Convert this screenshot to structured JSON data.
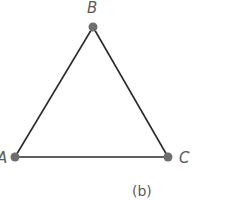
{
  "diagram": {
    "type": "triangle",
    "caption": "(b)",
    "vertices": [
      {
        "label": "A",
        "x": 15,
        "y": 157
      },
      {
        "label": "B",
        "x": 93,
        "y": 27
      },
      {
        "label": "C",
        "x": 168,
        "y": 157
      }
    ],
    "edges": [
      [
        "A",
        "B"
      ],
      [
        "B",
        "C"
      ],
      [
        "A",
        "C"
      ]
    ],
    "colors": {
      "edge": "#2a2a2a",
      "vertex": "#6e6e6e",
      "label": "#5a5a5a"
    }
  }
}
